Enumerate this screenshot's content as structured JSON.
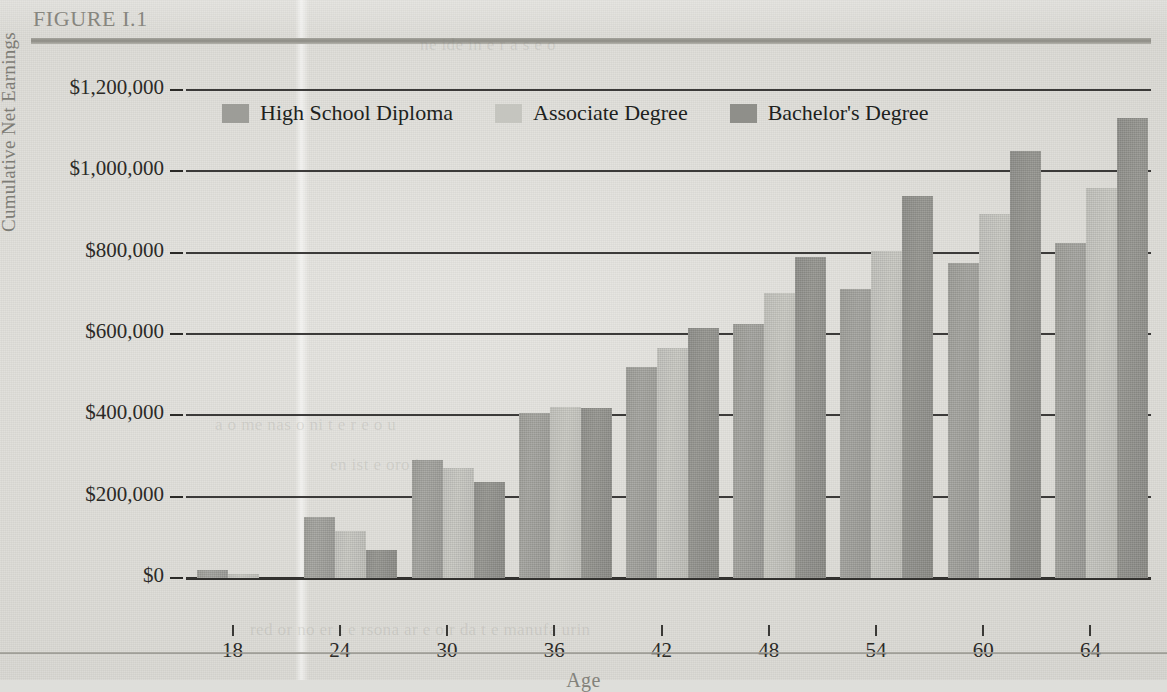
{
  "figure": {
    "label": "FIGURE I.1"
  },
  "ghost_text": {
    "line1": "a o me  nas   o   ni  t e  r e  o  u",
    "line2": "en ist    e  oro  i s",
    "line3": "red  or no   er  t  e rsona   ar  e    o  r  da  t e manufa  urin",
    "line4": "ne  ide  in  e     r  a  s  e  o"
  },
  "chart_data": {
    "type": "bar",
    "title": "FIGURE I.1",
    "xlabel": "Age",
    "ylabel": "Cumulative Net Earnings",
    "categories": [
      "18",
      "24",
      "30",
      "36",
      "42",
      "48",
      "54",
      "60",
      "64"
    ],
    "ylim": [
      0,
      1200000
    ],
    "ytick_values": [
      0,
      200000,
      400000,
      600000,
      800000,
      1000000,
      1200000
    ],
    "ytick_labels": [
      "$0",
      "$200,000",
      "$400,000",
      "$600,000",
      "$800,000",
      "$1,000,000",
      "$1,200,000"
    ],
    "grid": true,
    "legend_position": "top-left-inside",
    "series": [
      {
        "name": "High School Diploma",
        "color": "#9d9d98",
        "values": [
          20000,
          150000,
          290000,
          405000,
          520000,
          625000,
          710000,
          775000,
          825000
        ]
      },
      {
        "name": "Associate Degree",
        "color": "#c5c5bf",
        "values": [
          10000,
          115000,
          270000,
          420000,
          565000,
          700000,
          805000,
          895000,
          960000
        ]
      },
      {
        "name": "Bachelor's Degree",
        "color": "#8f8f8a",
        "values": [
          0,
          70000,
          235000,
          418000,
          615000,
          790000,
          940000,
          1050000,
          1130000
        ]
      }
    ]
  }
}
